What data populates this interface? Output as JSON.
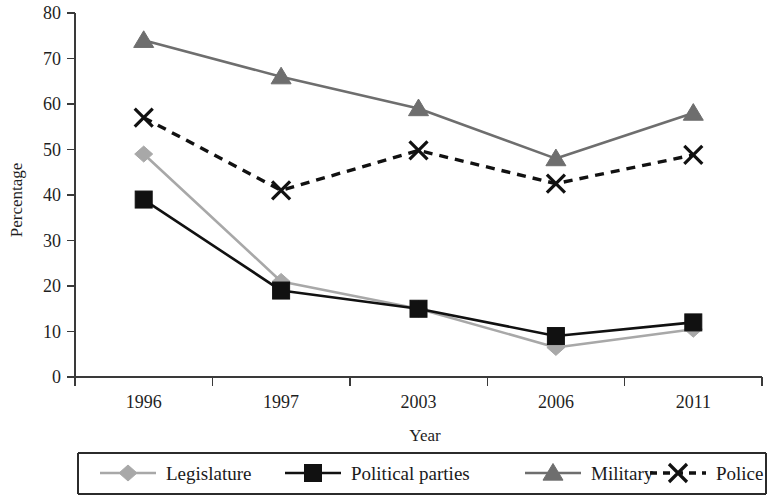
{
  "chart_data": {
    "type": "line",
    "title": "",
    "xlabel": "Year",
    "ylabel": "Percentage",
    "categories": [
      "1996",
      "1997",
      "2003",
      "2006",
      "2011"
    ],
    "ylim": [
      0,
      80
    ],
    "yticks": [
      0,
      10,
      20,
      30,
      40,
      50,
      60,
      70,
      80
    ],
    "grid": false,
    "legend_position": "bottom",
    "series": [
      {
        "name": "Legislature",
        "values": [
          49,
          21,
          15,
          6.5,
          10.5
        ],
        "color": "#a8a8a8",
        "marker": "diamond",
        "dash": "solid"
      },
      {
        "name": "Political parties",
        "values": [
          39,
          19,
          15,
          9,
          12
        ],
        "color": "#111111",
        "marker": "square",
        "dash": "solid"
      },
      {
        "name": "Military",
        "values": [
          74,
          66,
          59,
          48,
          58
        ],
        "color": "#6e6e6e",
        "marker": "triangle",
        "dash": "solid"
      },
      {
        "name": "Police",
        "values": [
          57,
          41,
          49.8,
          42.5,
          48.8
        ],
        "color": "#111111",
        "marker": "cross",
        "dash": "dashed"
      }
    ]
  },
  "axis": {
    "y_title": "Percentage",
    "x_title": "Year"
  },
  "legend": {
    "items": [
      {
        "label": "Legislature"
      },
      {
        "label": "Political parties"
      },
      {
        "label": "Military"
      },
      {
        "label": "Police"
      }
    ]
  }
}
